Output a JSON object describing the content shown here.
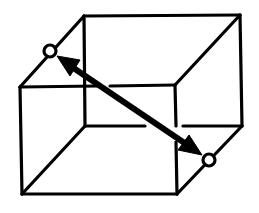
{
  "diagram": {
    "colors": {
      "stroke": "#000000",
      "background": "#ffffff",
      "vertex_fill": "#ffffff"
    },
    "vertices": {
      "back_top_left": [
        84,
        16
      ],
      "back_top_right": [
        240,
        15
      ],
      "back_bottom_right": [
        242,
        126
      ],
      "back_bottom_left": [
        85,
        126
      ],
      "front_top_left": [
        20,
        87
      ],
      "front_top_right": [
        175,
        85
      ],
      "front_bottom_right": [
        177,
        194
      ],
      "front_bottom_left": [
        22,
        194
      ]
    },
    "markers": [
      {
        "name": "start-vertex",
        "cx": 50,
        "cy": 51,
        "r": 6
      },
      {
        "name": "end-vertex",
        "cx": 209,
        "cy": 160,
        "r": 6
      }
    ],
    "arrow": {
      "type": "double-headed",
      "from": [
        50,
        51
      ],
      "to": [
        209,
        160
      ]
    }
  }
}
